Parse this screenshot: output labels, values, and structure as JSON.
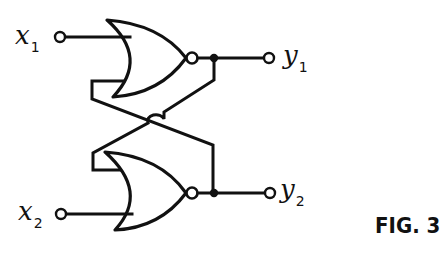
{
  "figure": {
    "title": "FIG. 3"
  },
  "inputs": [
    {
      "id": "x1",
      "var": "x",
      "sub": "1"
    },
    {
      "id": "x2",
      "var": "x",
      "sub": "2"
    }
  ],
  "outputs": [
    {
      "id": "y1",
      "var": "y",
      "sub": "1"
    },
    {
      "id": "y2",
      "var": "y",
      "sub": "2"
    }
  ],
  "gates": [
    {
      "id": "gate-upper",
      "type": "NOR",
      "inputs": [
        "x1",
        "y2"
      ],
      "output": "y1"
    },
    {
      "id": "gate-lower",
      "type": "NOR",
      "inputs": [
        "y1",
        "x2"
      ],
      "output": "y2"
    }
  ],
  "colors": {
    "ink": "#111111",
    "paper": "#ffffff"
  }
}
